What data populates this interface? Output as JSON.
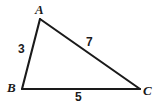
{
  "figure": {
    "kind": "triangle-diagram",
    "background_color": "#ffffff",
    "stroke_color": "#1a1a1a",
    "stroke_width": 2.1,
    "canvas": {
      "width": 156,
      "height": 107
    },
    "vertices": [
      {
        "id": "A",
        "label": "A",
        "x": 40,
        "y": 19
      },
      {
        "id": "B",
        "label": "B",
        "x": 22,
        "y": 89
      },
      {
        "id": "C",
        "label": "C",
        "x": 140,
        "y": 89
      }
    ],
    "edges": [
      {
        "id": "AB",
        "from": "A",
        "to": "B",
        "length_label": "3"
      },
      {
        "id": "AC",
        "from": "A",
        "to": "C",
        "length_label": "7"
      },
      {
        "id": "BC",
        "from": "B",
        "to": "C",
        "length_label": "5"
      }
    ],
    "vertex_labels": {
      "a": "A",
      "b": "B",
      "c": "C"
    },
    "side_labels": {
      "ab": "3",
      "ac": "7",
      "bc": "5"
    },
    "polygon_points": "40,19 22,89 140,89"
  }
}
